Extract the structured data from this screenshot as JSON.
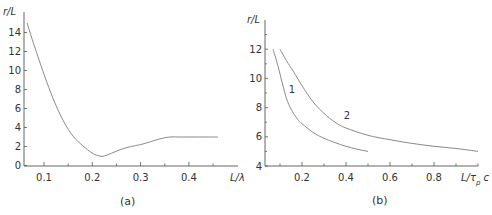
{
  "chart_data": [
    {
      "id": "a",
      "type": "line",
      "caption": "(a)",
      "xlabel": "L/λ",
      "ylabel": "r/L",
      "xlim": [
        0.058,
        0.46
      ],
      "ylim": [
        0,
        15.5
      ],
      "xticks": [
        0.1,
        0.2,
        0.3,
        0.4
      ],
      "xtick_labels": [
        "0.1",
        "0.2",
        "0.3",
        "0.4"
      ],
      "yticks": [
        0,
        2,
        4,
        6,
        8,
        10,
        12,
        14
      ],
      "ytick_labels": [
        "0",
        "2",
        "4",
        "6",
        "8",
        "10",
        "12",
        "14"
      ],
      "grid": false,
      "series": [
        {
          "name": "r/L",
          "x": [
            0.065,
            0.08,
            0.1,
            0.12,
            0.14,
            0.16,
            0.18,
            0.2,
            0.215,
            0.225,
            0.24,
            0.26,
            0.28,
            0.3,
            0.32,
            0.34,
            0.36,
            0.38,
            0.4,
            0.42,
            0.44,
            0.46
          ],
          "y": [
            15.0,
            12.6,
            9.6,
            6.9,
            4.7,
            3.1,
            2.1,
            1.3,
            1.0,
            1.0,
            1.3,
            1.7,
            2.0,
            2.2,
            2.5,
            2.8,
            3.0,
            3.0,
            3.0,
            3.0,
            3.0,
            3.0
          ]
        }
      ]
    },
    {
      "id": "b",
      "type": "line",
      "caption": "(b)",
      "xlabel": "L/τ_p c",
      "ylabel": "r/L",
      "xlim": [
        0.03,
        1.0
      ],
      "ylim": [
        4,
        13.5
      ],
      "xticks": [
        0.2,
        0.4,
        0.6,
        0.8
      ],
      "xtick_labels": [
        "0.2",
        "0.4",
        "0.6",
        "0.8"
      ],
      "yticks": [
        4,
        6,
        8,
        10,
        12
      ],
      "ytick_labels": [
        "4",
        "6",
        "8",
        "10",
        "12"
      ],
      "grid": false,
      "series": [
        {
          "name": "1",
          "x": [
            0.068,
            0.09,
            0.11,
            0.13,
            0.15,
            0.18,
            0.2,
            0.25,
            0.3,
            0.35,
            0.4,
            0.45,
            0.5
          ],
          "y": [
            12.0,
            10.9,
            9.7,
            8.6,
            7.9,
            7.2,
            6.9,
            6.3,
            5.9,
            5.6,
            5.35,
            5.15,
            5.0
          ]
        },
        {
          "name": "2",
          "x": [
            0.1,
            0.13,
            0.16,
            0.2,
            0.25,
            0.3,
            0.35,
            0.4,
            0.5,
            0.6,
            0.7,
            0.8,
            0.9,
            1.0
          ],
          "y": [
            12.0,
            11.2,
            10.5,
            9.5,
            8.4,
            7.6,
            7.0,
            6.6,
            6.1,
            5.8,
            5.55,
            5.35,
            5.2,
            5.0
          ]
        }
      ],
      "annotations": [
        {
          "text": "1",
          "x": 0.14,
          "y": 9.0
        },
        {
          "text": "2",
          "x": 0.39,
          "y": 7.2
        }
      ]
    }
  ]
}
